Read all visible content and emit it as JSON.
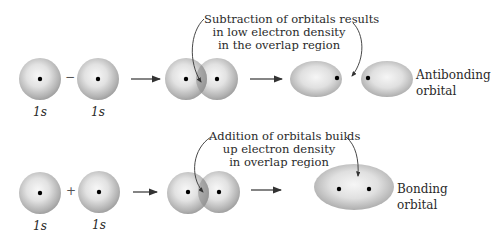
{
  "top_row": {
    "orbital_a_label": "1s",
    "orbital_b_label": "1s",
    "operator": "−",
    "annotation": [
      "Subtraction of orbitals results",
      "in low electron density",
      "in the overlap region"
    ],
    "result_label": [
      "Antibonding",
      "orbital"
    ]
  },
  "bottom_row": {
    "orbital_a_label": "1s",
    "orbital_b_label": "1s",
    "operator": "+",
    "annotation": [
      "Addition of orbitals builds",
      "up electron density",
      "in overlap region"
    ],
    "result_label": [
      "Bonding",
      "orbital"
    ]
  },
  "colors": {
    "sphere_light": "#f4f4f4",
    "sphere_dark": "#9a9a9a",
    "overlap": "#8a8a8a",
    "nucleus": "#000000",
    "arrow": "#333333"
  }
}
